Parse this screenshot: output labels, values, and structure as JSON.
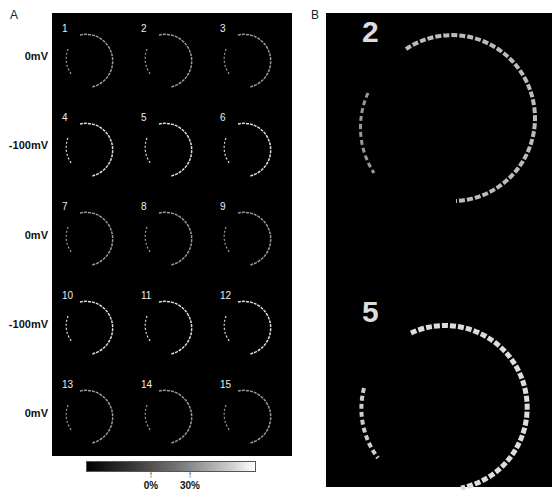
{
  "panels": {
    "a_label": "A",
    "b_label": "B"
  },
  "row_labels": [
    "0mV",
    "-100mV",
    "0mV",
    "-100mV",
    "0mV"
  ],
  "cells": [
    "1",
    "2",
    "3",
    "4",
    "5",
    "6",
    "7",
    "8",
    "9",
    "10",
    "11",
    "12",
    "13",
    "14",
    "15"
  ],
  "panel_b": {
    "top_label": "2",
    "bottom_label": "5"
  },
  "colorbar": {
    "ticks": [
      {
        "arrow": "↑",
        "label": "0%"
      },
      {
        "arrow": "↑",
        "label": "30%"
      }
    ]
  },
  "colors": {
    "background": "#000000",
    "ring": "#cccccc"
  }
}
